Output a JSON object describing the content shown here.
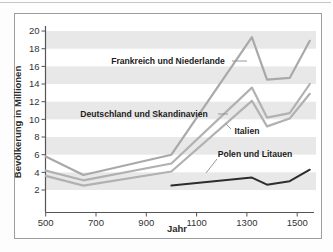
{
  "figure": {
    "frame_color": "#9e9e9e",
    "band_color": "#e8e8e8",
    "axis_color": "#555555",
    "tick_text_color": "#333333",
    "leader_color": "#999999"
  },
  "chart_data": {
    "type": "line",
    "title": "",
    "xlabel": "Jahr",
    "ylabel": "Bevölkerung in Millionen",
    "x_ticks": [
      500,
      700,
      900,
      1100,
      1300,
      1500
    ],
    "y_ticks": [
      2,
      4,
      6,
      8,
      10,
      12,
      14,
      16,
      18,
      20
    ],
    "xlim": [
      500,
      1560
    ],
    "ylim": [
      0,
      20
    ],
    "grid": "horizontal gray bands, no gridlines",
    "band_ranges": [
      [
        2,
        4
      ],
      [
        6,
        8
      ],
      [
        10,
        12
      ],
      [
        14,
        16
      ],
      [
        18,
        20
      ]
    ],
    "legend_position": "inline labels with leader lines",
    "series": [
      {
        "name": "Frankreich und Niederlande",
        "color": "#a9a9a9",
        "width": 2.2,
        "points": [
          [
            500,
            5.8
          ],
          [
            650,
            3.7
          ],
          [
            1000,
            6.0
          ],
          [
            1320,
            19.3
          ],
          [
            1380,
            14.5
          ],
          [
            1470,
            14.7
          ],
          [
            1550,
            18.9
          ]
        ]
      },
      {
        "name": "Deutschland und Skandinavien",
        "color": "#b1b1b1",
        "width": 2.2,
        "points": [
          [
            500,
            4.2
          ],
          [
            650,
            3.1
          ],
          [
            1000,
            5.0
          ],
          [
            1320,
            13.6
          ],
          [
            1380,
            10.2
          ],
          [
            1470,
            10.7
          ],
          [
            1550,
            14.0
          ]
        ]
      },
      {
        "name": "Italien",
        "color": "#b1b1b1",
        "width": 2.2,
        "points": [
          [
            500,
            3.6
          ],
          [
            650,
            2.5
          ],
          [
            1000,
            4.1
          ],
          [
            1320,
            12.1
          ],
          [
            1380,
            9.2
          ],
          [
            1470,
            10.1
          ],
          [
            1550,
            12.9
          ]
        ]
      },
      {
        "name": "Polen und Litauen",
        "color": "#2d2d2d",
        "width": 2.0,
        "points": [
          [
            1000,
            2.5
          ],
          [
            1320,
            3.4
          ],
          [
            1380,
            2.6
          ],
          [
            1470,
            3.0
          ],
          [
            1550,
            4.3
          ]
        ]
      }
    ],
    "annotations": [
      {
        "series": 0,
        "x": 168,
        "y": 64,
        "leader": [
          232,
          61,
          247,
          61
        ]
      },
      {
        "series": 1,
        "x": 144,
        "y": 117,
        "leader": [
          218,
          114,
          228,
          114
        ]
      },
      {
        "series": 2,
        "x": 247,
        "y": 134,
        "leader": [
          231,
          129,
          225,
          123
        ]
      },
      {
        "series": 3,
        "x": 255,
        "y": 157,
        "leader": [
          217,
          159,
          206,
          173
        ]
      }
    ]
  }
}
